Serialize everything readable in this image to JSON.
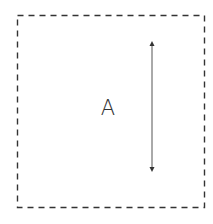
{
  "diagram": {
    "type": "region-with-dimension-arrow",
    "region": {
      "label": "A",
      "border_style": "dashed",
      "border_color": "#333333",
      "bounds": {
        "x1": 17,
        "y1": 15,
        "x2": 204,
        "y2": 207
      }
    },
    "arrow": {
      "direction": "vertical",
      "heads": "both",
      "color": "#555555",
      "x": 152,
      "y_start": 43,
      "y_end": 170
    }
  }
}
